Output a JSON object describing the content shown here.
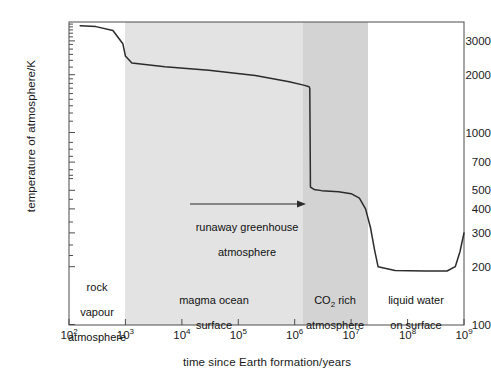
{
  "chart_data": {
    "type": "line",
    "title": "",
    "xlabel": "time since Earth formation/years",
    "ylabel": "temperature of atmosphere/K",
    "xscale": "log",
    "yscale": "log",
    "xlim": [
      100,
      1000000000
    ],
    "ylim": [
      100,
      3600
    ],
    "grid": false,
    "legend": "none",
    "xticks": [
      "10^2",
      "10^3",
      "10^4",
      "10^5",
      "10^6",
      "10^7",
      "10^8",
      "10^9"
    ],
    "xtick_labels": [
      {
        "mantissa": "10",
        "exponent": "2"
      },
      {
        "mantissa": "10",
        "exponent": "3"
      },
      {
        "mantissa": "10",
        "exponent": "4"
      },
      {
        "mantissa": "10",
        "exponent": "5"
      },
      {
        "mantissa": "10",
        "exponent": "6"
      },
      {
        "mantissa": "10",
        "exponent": "7"
      },
      {
        "mantissa": "10",
        "exponent": "8"
      },
      {
        "mantissa": "10",
        "exponent": "9"
      }
    ],
    "yticks": [
      100,
      200,
      300,
      400,
      500,
      700,
      1000,
      2000,
      3000
    ],
    "ytick_labels": [
      "100",
      "200",
      "300",
      "400",
      "500",
      "700",
      "1000",
      "2000",
      "3000"
    ],
    "series": [
      {
        "name": "atmosphere temperature",
        "x": [
          158,
          300,
          600,
          900,
          1000,
          1300,
          5000,
          30000,
          200000,
          800000,
          1500000,
          1800000,
          1850000,
          1900000,
          2200000,
          3000000,
          6000000,
          10000000,
          14000000,
          18000000,
          22000000,
          26000000,
          30000000,
          60000000,
          200000000,
          500000000,
          700000000,
          850000000,
          1000000000
        ],
        "y": [
          3600,
          3560,
          3400,
          2900,
          2500,
          2300,
          2200,
          2110,
          1980,
          1840,
          1760,
          1730,
          1700,
          520,
          505,
          498,
          492,
          480,
          455,
          400,
          320,
          245,
          200,
          191,
          190,
          190,
          200,
          240,
          300
        ]
      }
    ],
    "regions": [
      {
        "name": "rock-vapour",
        "label": "rock\nvapour\natmosphere",
        "x_start": 100,
        "x_end": 1000,
        "shade": "#ffffff",
        "label_x": 1000,
        "label_y": 150
      },
      {
        "name": "magma-ocean",
        "label": "magma ocean\nsurface",
        "x_start": 1000,
        "x_end": 19000000,
        "shade": "#e2e2e2",
        "label_x": 300000,
        "label_y": 150
      },
      {
        "name": "co2-rich",
        "label": "CO2 rich\natmosphere",
        "x_start": 19000000,
        "x_end": 200000000,
        "shade": "#d2d2d2",
        "label_x": 60000000,
        "label_y": 150
      },
      {
        "name": "liquid-water",
        "label": "liquid water\non surface",
        "x_start": 200000000,
        "x_end": 1000000000,
        "shade": "#ffffff",
        "label_x": 450000000,
        "label_y": 150
      }
    ],
    "annotations": [
      {
        "name": "runaway-greenhouse",
        "text": "runaway greenhouse\natmosphere",
        "arrow_x_start": 30000,
        "arrow_x_end": 20000000,
        "arrow_y": 420,
        "text_x": 1200000,
        "text_y": 370
      }
    ],
    "colors": {
      "line": "#2b2b2b",
      "axis": "#555555",
      "shade_light": "#e2e2e2",
      "shade_dark": "#d2d2d2",
      "background": "#ffffff",
      "text": "#1a1a1a"
    }
  },
  "region_labels": [
    {
      "line1": "rock",
      "line2": "vapour",
      "line3": "atmosphere"
    },
    {
      "line1": "magma ocean",
      "line2": "surface",
      "line3": ""
    },
    {
      "line1_a": "CO",
      "line1_sub": "2",
      "line1_b": " rich",
      "line2": "atmosphere",
      "line3": ""
    },
    {
      "line1": "liquid water",
      "line2": "on surface",
      "line3": ""
    }
  ],
  "annotation": {
    "line1": "runaway greenhouse",
    "line2": "atmosphere"
  },
  "axis": {
    "ylabel": "temperature of atmosphere/K",
    "xlabel": "time since Earth formation/years"
  }
}
